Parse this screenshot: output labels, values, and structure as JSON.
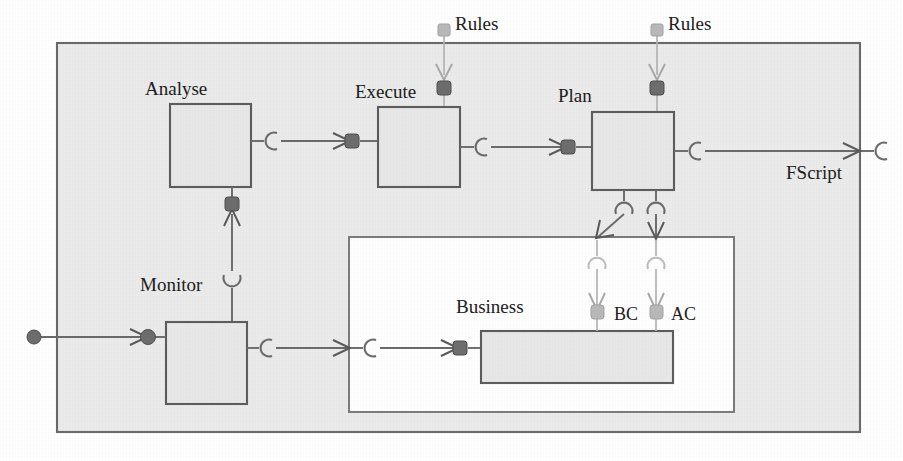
{
  "diagram": {
    "type": "component-diagram",
    "colors": {
      "outer_fill": "#ebebeb",
      "inner_fill": "#ffffff",
      "component_fill": "#e8e8e8",
      "stroke": "#6b6b6b",
      "port_dark": "#6e6e6e",
      "port_light": "#b9b9b9"
    },
    "outer_container": {
      "name": "autonomic-manager-container",
      "x": 57,
      "y": 43,
      "width": 803,
      "height": 389
    },
    "inner_container": {
      "name": "managed-resource-container",
      "x": 349,
      "y": 237,
      "width": 385,
      "height": 175
    },
    "components": [
      {
        "id": "analyse",
        "label": "Analyse",
        "x": 170,
        "y": 104,
        "width": 81,
        "height": 83,
        "label_x": 145,
        "label_y": 94
      },
      {
        "id": "execute",
        "label": "Execute",
        "x": 378,
        "y": 107,
        "width": 82,
        "height": 80,
        "label_x": 355,
        "label_y": 97
      },
      {
        "id": "plan",
        "label": "Plan",
        "x": 592,
        "y": 112,
        "width": 82,
        "height": 78,
        "label_x": 558,
        "label_y": 101
      },
      {
        "id": "monitor",
        "label": "Monitor",
        "x": 166,
        "y": 322,
        "width": 81,
        "height": 82,
        "label_x": 140,
        "label_y": 290
      },
      {
        "id": "business",
        "label": "Business",
        "x": 481,
        "y": 331,
        "width": 192,
        "height": 52,
        "label_x": 459,
        "label_y": 312
      }
    ],
    "external_labels": [
      {
        "id": "rules-execute",
        "text": "Rules",
        "x": 455,
        "y": 22
      },
      {
        "id": "rules-plan",
        "text": "Rules",
        "x": 673,
        "y": 22
      },
      {
        "id": "fscript",
        "text": "FScript",
        "x": 790,
        "y": 179
      },
      {
        "id": "bc",
        "text": "BC",
        "x": 617,
        "y": 321
      },
      {
        "id": "ac",
        "text": "AC",
        "x": 673,
        "y": 321
      }
    ],
    "ports": [
      {
        "id": "port-rules-execute-external",
        "style": "light",
        "x": 444,
        "y": 29,
        "shape": "square"
      },
      {
        "id": "port-rules-plan-external",
        "style": "light",
        "x": 657,
        "y": 29,
        "shape": "square"
      },
      {
        "id": "port-execute-rules-in",
        "style": "dark",
        "x": 444,
        "y": 88,
        "shape": "square"
      },
      {
        "id": "port-plan-rules-in",
        "style": "dark",
        "x": 657,
        "y": 88,
        "shape": "square"
      },
      {
        "id": "port-analyse-out",
        "style": "dark",
        "x": 352,
        "y": 141,
        "shape": "square"
      },
      {
        "id": "port-execute-out",
        "style": "dark",
        "x": 568,
        "y": 147,
        "shape": "square"
      },
      {
        "id": "port-monitor-analyse-out",
        "style": "dark",
        "x": 232,
        "y": 204,
        "shape": "square"
      },
      {
        "id": "port-input-external",
        "style": "dark",
        "x": 34,
        "y": 337,
        "shape": "circle"
      },
      {
        "id": "port-monitor-in",
        "style": "dark",
        "x": 148,
        "y": 337,
        "shape": "circle"
      },
      {
        "id": "port-business-in",
        "style": "dark",
        "x": 460,
        "y": 348,
        "shape": "square"
      },
      {
        "id": "port-bc",
        "style": "light",
        "x": 597,
        "y": 312,
        "shape": "square"
      },
      {
        "id": "port-ac",
        "style": "light",
        "x": 655,
        "y": 312,
        "shape": "square"
      }
    ],
    "connections": [
      {
        "id": "conn-rules-to-execute",
        "from": "Rules (external)",
        "to": "Execute",
        "direction": "down"
      },
      {
        "id": "conn-rules-to-plan",
        "from": "Rules (external)",
        "to": "Plan",
        "direction": "down"
      },
      {
        "id": "conn-analyse-to-execute",
        "from": "Analyse",
        "to": "Execute",
        "direction": "right"
      },
      {
        "id": "conn-execute-to-plan",
        "from": "Execute",
        "to": "Plan",
        "direction": "right"
      },
      {
        "id": "conn-plan-to-fscript",
        "from": "Plan",
        "to": "FScript",
        "direction": "right"
      },
      {
        "id": "conn-monitor-to-analyse",
        "from": "Monitor",
        "to": "Analyse",
        "direction": "up"
      },
      {
        "id": "conn-input-to-monitor",
        "from": "Input",
        "to": "Monitor",
        "direction": "right"
      },
      {
        "id": "conn-monitor-to-business",
        "from": "Monitor",
        "to": "Business",
        "direction": "right"
      },
      {
        "id": "conn-plan-to-bc",
        "from": "Plan",
        "to": "BC",
        "direction": "down"
      },
      {
        "id": "conn-plan-to-ac",
        "from": "Plan",
        "to": "AC",
        "direction": "down"
      }
    ]
  }
}
